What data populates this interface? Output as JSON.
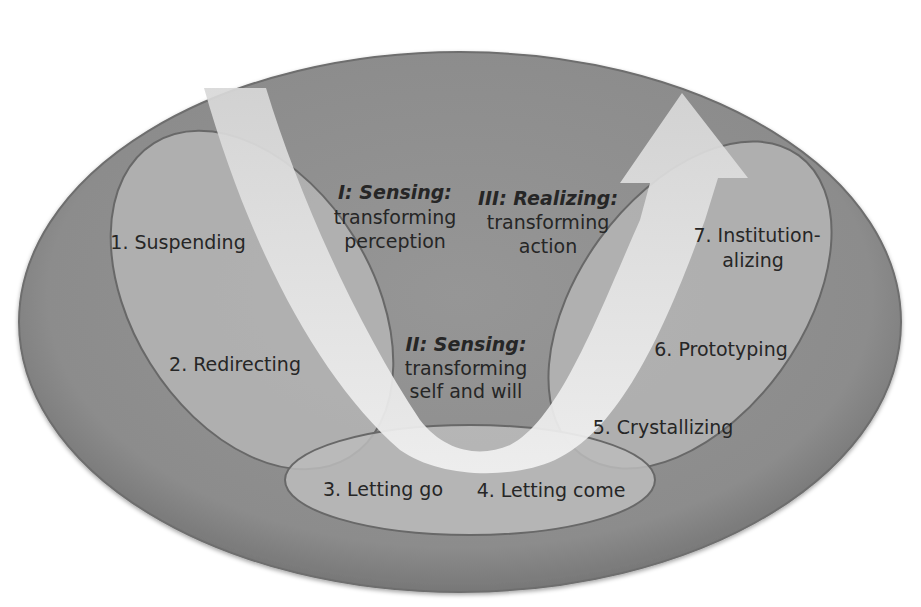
{
  "diagram": {
    "type": "U-process",
    "colors": {
      "background": "#ffffff",
      "outer_ellipse": "#8f8f8f",
      "outer_ellipse_edge": "#6e6e6e",
      "inner_ellipse": "#b4b4b4",
      "inner_ellipse_stroke": "#6a6a6a",
      "arrow": "#e6e6e6",
      "text": "#262626"
    },
    "phases": [
      {
        "id": "I",
        "title": "I: Sensing:",
        "line1": "transforming",
        "line2": "perception"
      },
      {
        "id": "II",
        "title": "II: Sensing:",
        "line1": "transforming",
        "line2": "self and will"
      },
      {
        "id": "III",
        "title": "III: Realizing:",
        "line1": "transforming",
        "line2": "action"
      }
    ],
    "steps": [
      {
        "n": 1,
        "label": "1. Suspending"
      },
      {
        "n": 2,
        "label": "2. Redirecting"
      },
      {
        "n": 3,
        "label": "3. Letting go"
      },
      {
        "n": 4,
        "label": "4. Letting come"
      },
      {
        "n": 5,
        "label": "5. Crystallizing"
      },
      {
        "n": 6,
        "label": "6. Prototyping"
      },
      {
        "n": 7,
        "label_line1": "7. Institution-",
        "label_line2": "alizing"
      }
    ],
    "arrow": {
      "shape": "u-arrow",
      "direction": "down-then-up"
    }
  }
}
